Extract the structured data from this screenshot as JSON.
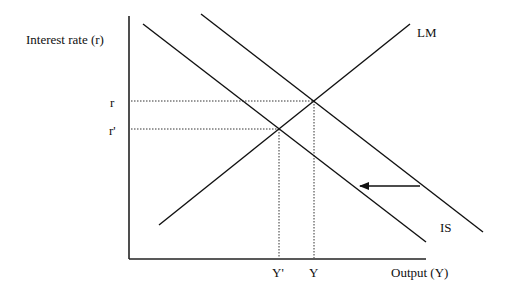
{
  "diagram": {
    "y_axis_label": "Interest rate (r)",
    "x_axis_label": "Output (Y)",
    "curves": {
      "lm_label": "LM",
      "is_label": "IS"
    },
    "ticks": {
      "r": "r",
      "r_prime": "r'",
      "y": "Y",
      "y_prime": "Y'"
    },
    "shift_direction": "left"
  },
  "colors": {
    "line": "#111111",
    "guide": "#333333",
    "background": "#ffffff"
  }
}
